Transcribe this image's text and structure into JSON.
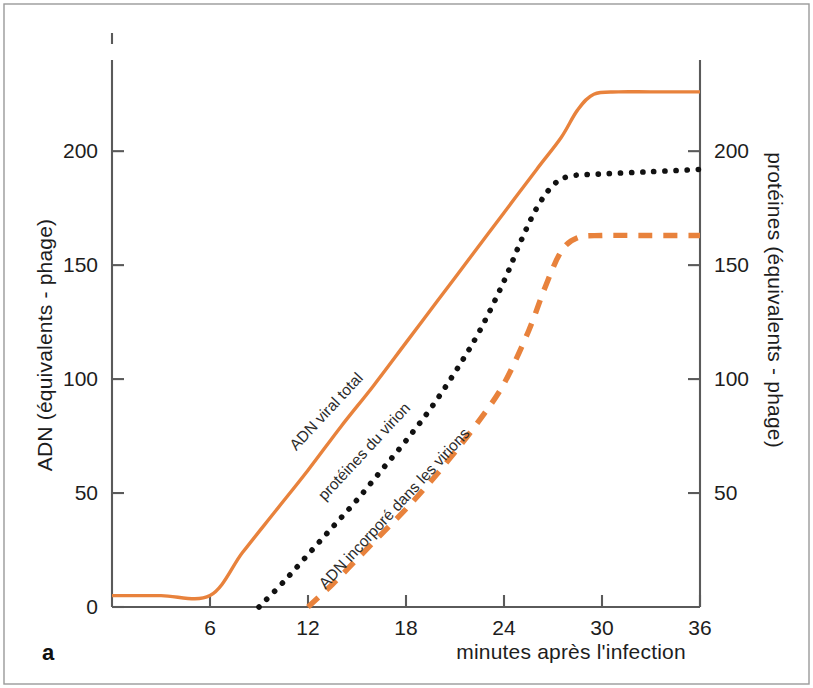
{
  "figure": {
    "panel_letter": "a",
    "background_color": "#ffffff",
    "accent_color": "#e8823c",
    "dot_color": "#111111"
  },
  "axes": {
    "left": {
      "label": "ADN (équivalents - phage)",
      "ticks": [
        0,
        50,
        100,
        150,
        200
      ],
      "tick_labels": [
        "0",
        "50",
        "100",
        "150",
        "200"
      ],
      "range": [
        0,
        240
      ]
    },
    "right": {
      "label": "protéines (équivalents - phage)",
      "ticks": [
        50,
        100,
        150,
        200
      ],
      "tick_labels": [
        "50",
        "100",
        "150",
        "200"
      ],
      "range": [
        0,
        240
      ]
    },
    "bottom": {
      "label": "minutes après l'infection",
      "ticks": [
        6,
        12,
        18,
        24,
        30,
        36
      ],
      "tick_labels": [
        "6",
        "12",
        "18",
        "24",
        "30",
        "36"
      ],
      "range": [
        0,
        36
      ]
    }
  },
  "annotations": [
    {
      "id": "adn-viral-total",
      "text": "ADN viral total",
      "x": 330,
      "y": 415,
      "rotation": -47
    },
    {
      "id": "proteines-du-virion",
      "text": "protéines du virion",
      "x": 368,
      "y": 455,
      "rotation": -47
    },
    {
      "id": "adn-incorpore",
      "text": "ADN incorporé dans les virions",
      "x": 398,
      "y": 512,
      "rotation": -47
    }
  ],
  "chart_data": {
    "type": "line",
    "title": "",
    "subtitle": "",
    "xlabel": "minutes après l'infection",
    "ylabel": "ADN (équivalents - phage)",
    "y2label": "protéines (équivalents - phage)",
    "xlim": [
      0,
      36
    ],
    "ylim": [
      0,
      240
    ],
    "y2lim": [
      0,
      240
    ],
    "xticks": [
      6,
      12,
      18,
      24,
      30,
      36
    ],
    "yticks": [
      0,
      50,
      100,
      150,
      200
    ],
    "y2ticks": [
      50,
      100,
      150,
      200
    ],
    "grid": false,
    "legend_position": "inline-curve-labels",
    "panel_label": "a",
    "series": [
      {
        "name": "ADN viral total",
        "axis": "left",
        "style": "solid",
        "color": "#e8823c",
        "plateau_value": 226,
        "onset_minutes": 6,
        "plateau_minutes": 29,
        "points": [
          [
            0,
            5
          ],
          [
            3,
            5
          ],
          [
            6,
            5
          ],
          [
            8,
            24
          ],
          [
            10,
            42
          ],
          [
            12,
            60
          ],
          [
            14,
            79
          ],
          [
            16,
            97
          ],
          [
            18,
            116
          ],
          [
            20,
            135
          ],
          [
            22,
            154
          ],
          [
            24,
            173
          ],
          [
            26,
            192
          ],
          [
            27.5,
            206
          ],
          [
            28.5,
            218
          ],
          [
            29.5,
            225
          ],
          [
            31,
            226
          ],
          [
            33,
            226
          ],
          [
            36,
            226
          ]
        ]
      },
      {
        "name": "protéines du virion",
        "axis": "right",
        "style": "dotted",
        "color": "#111111",
        "plateau_value": 190,
        "onset_minutes": 9,
        "plateau_minutes": 27,
        "points": [
          [
            9,
            0
          ],
          [
            10.5,
            11
          ],
          [
            12,
            23
          ],
          [
            13.5,
            35
          ],
          [
            15,
            47
          ],
          [
            16.5,
            60
          ],
          [
            18,
            73
          ],
          [
            19.5,
            87
          ],
          [
            21,
            103
          ],
          [
            22.5,
            121
          ],
          [
            24,
            143
          ],
          [
            25,
            160
          ],
          [
            26,
            175
          ],
          [
            27,
            185
          ],
          [
            28,
            189
          ],
          [
            30,
            190
          ],
          [
            33,
            191
          ],
          [
            36,
            192
          ]
        ]
      },
      {
        "name": "ADN incorporé dans les virions",
        "axis": "left",
        "style": "dashed",
        "color": "#e8823c",
        "plateau_value": 163,
        "onset_minutes": 12,
        "plateau_minutes": 28,
        "points": [
          [
            12,
            0
          ],
          [
            13.5,
            10
          ],
          [
            15,
            21
          ],
          [
            16.5,
            32
          ],
          [
            18,
            43
          ],
          [
            19.5,
            55
          ],
          [
            21,
            68
          ],
          [
            22.5,
            82
          ],
          [
            24,
            98
          ],
          [
            25.5,
            121
          ],
          [
            26.5,
            140
          ],
          [
            27.5,
            156
          ],
          [
            28.5,
            162
          ],
          [
            30,
            163
          ],
          [
            33,
            163
          ],
          [
            36,
            163
          ]
        ]
      }
    ]
  }
}
